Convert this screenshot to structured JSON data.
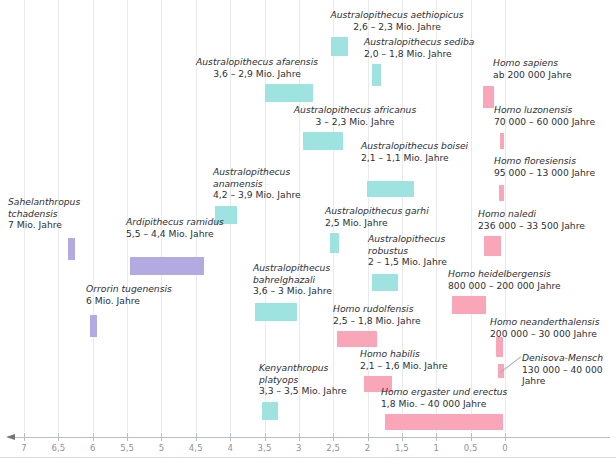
{
  "chart_data": {
    "type": "bar",
    "orientation": "horizontal-timeline",
    "title": "",
    "xlabel": "",
    "ylabel": "",
    "xlim": [
      7.2,
      -0.35
    ],
    "x_unit": "Millionen Jahre vor heute",
    "xticks": [
      7,
      6.5,
      6,
      5.5,
      5,
      4.5,
      4,
      3.5,
      3,
      2.5,
      2,
      1.5,
      1,
      0.5,
      0
    ],
    "xticklabels": [
      "7",
      "6,5",
      "6",
      "5,5",
      "5",
      "4,5",
      "4",
      "3,5",
      "3",
      "2,5",
      "2",
      "1,5",
      "1",
      "0,5",
      "0"
    ],
    "grid": true,
    "legend": "none",
    "axis_direction": "descending-left-to-right",
    "series": [
      {
        "name": "Vormenschen / frühe Hominini",
        "color": "#b3aae2",
        "values": [
          {
            "taxon": "Sahelanthropus tchadensis",
            "range_text": "7 Mio. Jahre",
            "start_mya": 7.05,
            "end_mya": 6.92,
            "bar": {
              "x": 68,
              "y": 238,
              "w": 7,
              "h": 22
            },
            "label": {
              "x": 8,
              "y": 196,
              "w": 96,
              "align": "left"
            }
          },
          {
            "taxon": "Orrorin tugenensis",
            "range_text": "6 Mio. Jahre",
            "start_mya": 6.06,
            "end_mya": 5.94,
            "bar": {
              "x": 90,
              "y": 315,
              "w": 7,
              "h": 22
            },
            "label": {
              "x": 86,
              "y": 283,
              "w": 110,
              "align": "left"
            }
          },
          {
            "taxon": "Ardipithecus ramidus",
            "range_text": "5,5 – 4,4 Mio. Jahre",
            "start_mya": 5.5,
            "end_mya": 4.4,
            "bar": {
              "x": 130,
              "y": 257,
              "w": 74,
              "h": 18
            },
            "label": {
              "x": 126,
              "y": 216,
              "w": 120,
              "align": "left"
            }
          }
        ]
      },
      {
        "name": "Australopithecinen",
        "color": "#9ee3e0",
        "values": [
          {
            "taxon": "Australopithecus anamensis",
            "range_text": "4,2 – 3,9 Mio. Jahre",
            "start_mya": 4.2,
            "end_mya": 3.9,
            "bar": {
              "x": 215,
              "y": 206,
              "w": 22,
              "h": 18
            },
            "label": {
              "x": 213,
              "y": 166,
              "w": 112,
              "align": "left"
            }
          },
          {
            "taxon": "Kenyanthropus platyops",
            "range_text": "3,3 – 3,5 Mio. Jahre",
            "start_mya": 3.5,
            "end_mya": 3.3,
            "bar": {
              "x": 262,
              "y": 402,
              "w": 16,
              "h": 18
            },
            "label": {
              "x": 259,
              "y": 362,
              "w": 110,
              "align": "left"
            }
          },
          {
            "taxon": "Australopithecus bahrelghazali",
            "range_text": "3,6 – 3 Mio. Jahre",
            "start_mya": 3.6,
            "end_mya": 3.0,
            "bar": {
              "x": 255,
              "y": 303,
              "w": 42,
              "h": 18
            },
            "label": {
              "x": 253,
              "y": 262,
              "w": 112,
              "align": "left"
            }
          },
          {
            "taxon": "Australopithecus afarensis",
            "range_text": "3,6 – 2,9 Mio. Jahre",
            "start_mya": 3.6,
            "end_mya": 2.9,
            "bar": {
              "x": 265,
              "y": 84,
              "w": 48,
              "h": 18
            },
            "label": {
              "x": 183,
              "y": 56,
              "w": 148,
              "align": "center"
            }
          },
          {
            "taxon": "Australopithecus africanus",
            "range_text": "3 – 2,3 Mio. Jahre",
            "start_mya": 3.0,
            "end_mya": 2.3,
            "bar": {
              "x": 303,
              "y": 132,
              "w": 40,
              "h": 18
            },
            "label": {
              "x": 290,
              "y": 104,
              "w": 130,
              "align": "center"
            }
          },
          {
            "taxon": "Australopithecus aethiopicus",
            "range_text": "2,6 – 2,3 Mio. Jahre",
            "start_mya": 2.6,
            "end_mya": 2.3,
            "bar": {
              "x": 331,
              "y": 37,
              "w": 17,
              "h": 19
            },
            "label": {
              "x": 323,
              "y": 9,
              "w": 148,
              "align": "center"
            }
          },
          {
            "taxon": "Australopithecus garhi",
            "range_text": "2,5 Mio. Jahre",
            "start_mya": 2.55,
            "end_mya": 2.45,
            "bar": {
              "x": 330,
              "y": 233,
              "w": 9,
              "h": 20
            },
            "label": {
              "x": 325,
              "y": 205,
              "w": 112,
              "align": "left"
            }
          },
          {
            "taxon": "Australopithecus boisei",
            "range_text": "2,1 – 1,1 Mio. Jahre",
            "start_mya": 2.1,
            "end_mya": 1.1,
            "bar": {
              "x": 367,
              "y": 181,
              "w": 47,
              "h": 16
            },
            "label": {
              "x": 361,
              "y": 140,
              "w": 112,
              "align": "left"
            }
          },
          {
            "taxon": "Australopithecus robustus",
            "range_text": "2 – 1,5 Mio. Jahre",
            "start_mya": 2.0,
            "end_mya": 1.5,
            "bar": {
              "x": 372,
              "y": 274,
              "w": 26,
              "h": 17
            },
            "label": {
              "x": 368,
              "y": 233,
              "w": 100,
              "align": "left"
            }
          },
          {
            "taxon": "Australopithecus sediba",
            "range_text": "2,0 – 1,8 Mio. Jahre",
            "start_mya": 2.0,
            "end_mya": 1.8,
            "bar": {
              "x": 372,
              "y": 64,
              "w": 9,
              "h": 22
            },
            "label": {
              "x": 364,
              "y": 36,
              "w": 116,
              "align": "left"
            }
          }
        ]
      },
      {
        "name": "Gattung Homo",
        "color": "#f8a6b8",
        "values": [
          {
            "taxon": "Homo rudolfensis",
            "range_text": "2,5 – 1,8 Mio. Jahre",
            "start_mya": 2.5,
            "end_mya": 1.8,
            "bar": {
              "x": 337,
              "y": 331,
              "w": 40,
              "h": 16
            },
            "label": {
              "x": 333,
              "y": 303,
              "w": 112,
              "align": "left"
            }
          },
          {
            "taxon": "Homo habilis",
            "range_text": "2,1 – 1,6 Mio. Jahre",
            "start_mya": 2.1,
            "end_mya": 1.6,
            "bar": {
              "x": 364,
              "y": 376,
              "w": 28,
              "h": 16
            },
            "label": {
              "x": 360,
              "y": 348,
              "w": 112,
              "align": "left"
            }
          },
          {
            "taxon": "Homo ergaster und erectus",
            "range_text": "1,8 Mio. – 40 000 Jahre",
            "start_mya": 1.8,
            "end_mya": 0.04,
            "bar": {
              "x": 385,
              "y": 414,
              "w": 118,
              "h": 16
            },
            "label": {
              "x": 381,
              "y": 386,
              "w": 142,
              "align": "left"
            }
          },
          {
            "taxon": "Homo heidelbergensis",
            "range_text": "800 000 – 200 000 Jahre",
            "start_mya": 0.8,
            "end_mya": 0.2,
            "bar": {
              "x": 452,
              "y": 296,
              "w": 34,
              "h": 18
            },
            "label": {
              "x": 448,
              "y": 268,
              "w": 140,
              "align": "left"
            }
          },
          {
            "taxon": "Homo naledi",
            "range_text": "236 000 – 33 500 Jahre",
            "start_mya": 0.236,
            "end_mya": 0.0335,
            "bar": {
              "x": 484,
              "y": 236,
              "w": 17,
              "h": 20
            },
            "label": {
              "x": 478,
              "y": 208,
              "w": 132,
              "align": "left"
            }
          },
          {
            "taxon": "Homo neanderthalensis",
            "range_text": "200 000 – 30 000 Jahre",
            "start_mya": 0.2,
            "end_mya": 0.03,
            "bar": {
              "x": 496,
              "y": 337,
              "w": 7,
              "h": 20
            },
            "label": {
              "x": 490,
              "y": 316,
              "w": 122,
              "align": "left"
            }
          },
          {
            "taxon": "Denisova-Mensch",
            "range_text": "130 000 – 40 000 Jahre",
            "start_mya": 0.13,
            "end_mya": 0.04,
            "bar": {
              "x": 498,
              "y": 364,
              "w": 6,
              "h": 14
            },
            "label": {
              "x": 522,
              "y": 352,
              "w": 90,
              "align": "left"
            }
          },
          {
            "taxon": "Homo floresiensis",
            "range_text": "95 000 – 13 000 Jahre",
            "start_mya": 0.095,
            "end_mya": 0.013,
            "bar": {
              "x": 499,
              "y": 185,
              "w": 5,
              "h": 16
            },
            "label": {
              "x": 494,
              "y": 155,
              "w": 118,
              "align": "left"
            }
          },
          {
            "taxon": "Homo luzonensis",
            "range_text": "70 000 – 60 000 Jahre",
            "start_mya": 0.07,
            "end_mya": 0.06,
            "bar": {
              "x": 500,
              "y": 133,
              "w": 4,
              "h": 16
            },
            "label": {
              "x": 494,
              "y": 104,
              "w": 118,
              "align": "left"
            }
          },
          {
            "taxon": "Homo sapiens",
            "range_text": "ab 200 000 Jahre",
            "start_mya": 0.2,
            "end_mya": 0.0,
            "bar": {
              "x": 483,
              "y": 86,
              "w": 11,
              "h": 22
            },
            "label": {
              "x": 493,
              "y": 57,
              "w": 110,
              "align": "left"
            }
          }
        ]
      }
    ]
  },
  "colors": {
    "early_hominin": "#b3aae2",
    "australopithecine": "#9ee3e0",
    "homo": "#f8a6b8",
    "gridline": "#e9eaec",
    "axis": "#b9bcc0",
    "tick_text": "#8e9298",
    "label_text": "#2d2f33",
    "background": "#ffffff"
  },
  "axis": {
    "arrow_direction": "left",
    "line_y": 437,
    "left_x": 14,
    "right_x": 610
  }
}
